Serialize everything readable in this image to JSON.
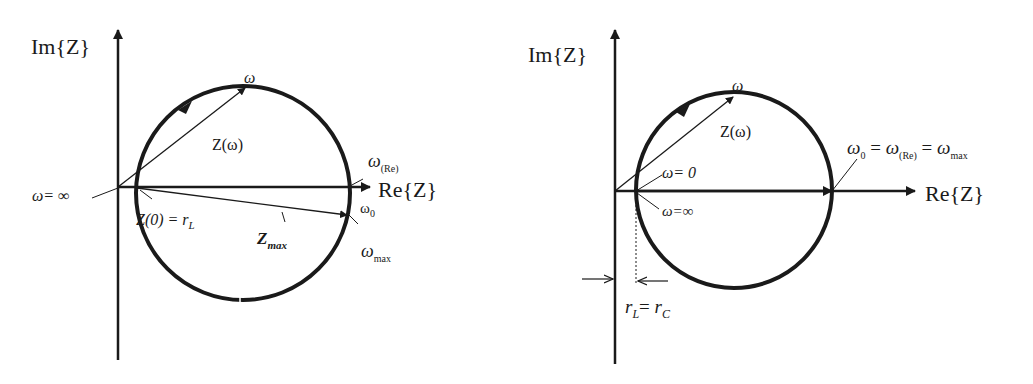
{
  "left_diagram": {
    "axis_im_label": "Im{Z}",
    "axis_re_label": "Re{Z}",
    "omega_label": "ω",
    "z_omega_label": "Z(ω)",
    "omega_inf_label": "ω= ∞",
    "z0_label": "Z(0) = r",
    "z0_sub": "L",
    "omega_re_label": "ω",
    "omega_re_sub": "(Re)",
    "omega0_label": "ω",
    "omega0_sub": "0",
    "zmax_label": "Z",
    "zmax_sub": "max",
    "omega_max_label": "ω",
    "omega_max_sub": "max"
  },
  "right_diagram": {
    "axis_im_label": "Im{Z}",
    "axis_re_label": "Re{Z}",
    "omega_label": "ω",
    "z_omega_label": "Z(ω)",
    "omega_zero_label": "ω= 0",
    "omega_inf_label": "ω=∞",
    "equality_label_parts": {
      "w0": "ω",
      "w0_sub": "0",
      "eq1": " = ",
      "wre": "ω",
      "wre_sub": "(Re)",
      "eq2": " = ",
      "wmax": "ω",
      "wmax_sub": "max"
    },
    "rl_rc_label": {
      "r1": "r",
      "sub1": "L",
      "eq": "= ",
      "r2": "r",
      "sub2": "C"
    }
  },
  "colors": {
    "stroke": "#1a1a1a",
    "background": "#ffffff"
  }
}
